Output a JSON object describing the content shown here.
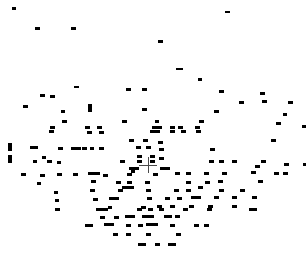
{
  "chart_data": {
    "type": "scatter",
    "title": "",
    "subtitle": "",
    "xlabel": "",
    "ylabel": "",
    "xlim": [
      0,
      306
    ],
    "ylim": [
      0,
      258
    ],
    "grid": false,
    "legend": null,
    "annotations": [],
    "background_color": "#ffffff",
    "marker_color": "#000000",
    "cursor_color": "#4a4a4a",
    "marker_shape": "horizontal-dash",
    "point_count": 214,
    "cursor": {
      "label": "crosshair-cursor",
      "x": 148,
      "y": 165,
      "arm_length_h": 18,
      "arm_length_v": 16
    },
    "points": [
      {
        "x": 12,
        "y": 7,
        "w": 4,
        "h": 3
      },
      {
        "x": 225,
        "y": 11,
        "w": 5,
        "h": 2
      },
      {
        "x": 35,
        "y": 27,
        "w": 5,
        "h": 3
      },
      {
        "x": 71,
        "y": 27,
        "w": 5,
        "h": 3
      },
      {
        "x": 158,
        "y": 40,
        "w": 5,
        "h": 3
      },
      {
        "x": 176,
        "y": 68,
        "w": 7,
        "h": 2
      },
      {
        "x": 198,
        "y": 78,
        "w": 4,
        "h": 3
      },
      {
        "x": 74,
        "y": 86,
        "w": 5,
        "h": 2
      },
      {
        "x": 126,
        "y": 88,
        "w": 5,
        "h": 3
      },
      {
        "x": 142,
        "y": 88,
        "w": 5,
        "h": 3
      },
      {
        "x": 219,
        "y": 90,
        "w": 5,
        "h": 3
      },
      {
        "x": 40,
        "y": 94,
        "w": 5,
        "h": 3
      },
      {
        "x": 50,
        "y": 95,
        "w": 5,
        "h": 3
      },
      {
        "x": 260,
        "y": 92,
        "w": 5,
        "h": 3
      },
      {
        "x": 262,
        "y": 100,
        "w": 5,
        "h": 3
      },
      {
        "x": 239,
        "y": 101,
        "w": 5,
        "h": 3
      },
      {
        "x": 288,
        "y": 101,
        "w": 5,
        "h": 3
      },
      {
        "x": 23,
        "y": 105,
        "w": 5,
        "h": 3
      },
      {
        "x": 88,
        "y": 104,
        "w": 4,
        "h": 8
      },
      {
        "x": 142,
        "y": 108,
        "w": 5,
        "h": 3
      },
      {
        "x": 61,
        "y": 110,
        "w": 4,
        "h": 3
      },
      {
        "x": 214,
        "y": 110,
        "w": 5,
        "h": 3
      },
      {
        "x": 283,
        "y": 113,
        "w": 4,
        "h": 3
      },
      {
        "x": 62,
        "y": 120,
        "w": 5,
        "h": 3
      },
      {
        "x": 122,
        "y": 120,
        "w": 5,
        "h": 3
      },
      {
        "x": 155,
        "y": 120,
        "w": 4,
        "h": 3
      },
      {
        "x": 199,
        "y": 120,
        "w": 5,
        "h": 3
      },
      {
        "x": 276,
        "y": 122,
        "w": 5,
        "h": 3
      },
      {
        "x": 50,
        "y": 126,
        "w": 5,
        "h": 3
      },
      {
        "x": 85,
        "y": 126,
        "w": 5,
        "h": 3
      },
      {
        "x": 97,
        "y": 126,
        "w": 5,
        "h": 3
      },
      {
        "x": 152,
        "y": 126,
        "w": 10,
        "h": 3
      },
      {
        "x": 170,
        "y": 126,
        "w": 5,
        "h": 3
      },
      {
        "x": 178,
        "y": 126,
        "w": 5,
        "h": 3
      },
      {
        "x": 195,
        "y": 126,
        "w": 5,
        "h": 3
      },
      {
        "x": 302,
        "y": 125,
        "w": 4,
        "h": 3
      },
      {
        "x": 49,
        "y": 130,
        "w": 5,
        "h": 3
      },
      {
        "x": 87,
        "y": 131,
        "w": 5,
        "h": 3
      },
      {
        "x": 99,
        "y": 131,
        "w": 5,
        "h": 3
      },
      {
        "x": 150,
        "y": 130,
        "w": 10,
        "h": 3
      },
      {
        "x": 170,
        "y": 130,
        "w": 5,
        "h": 3
      },
      {
        "x": 181,
        "y": 130,
        "w": 5,
        "h": 3
      },
      {
        "x": 196,
        "y": 130,
        "w": 5,
        "h": 3
      },
      {
        "x": 129,
        "y": 139,
        "w": 5,
        "h": 3
      },
      {
        "x": 143,
        "y": 139,
        "w": 5,
        "h": 3
      },
      {
        "x": 158,
        "y": 141,
        "w": 5,
        "h": 3
      },
      {
        "x": 271,
        "y": 139,
        "w": 5,
        "h": 3
      },
      {
        "x": 8,
        "y": 143,
        "w": 4,
        "h": 8
      },
      {
        "x": 30,
        "y": 146,
        "w": 8,
        "h": 3
      },
      {
        "x": 58,
        "y": 147,
        "w": 5,
        "h": 3
      },
      {
        "x": 71,
        "y": 147,
        "w": 10,
        "h": 3
      },
      {
        "x": 82,
        "y": 147,
        "w": 5,
        "h": 3
      },
      {
        "x": 90,
        "y": 147,
        "w": 4,
        "h": 3
      },
      {
        "x": 99,
        "y": 147,
        "w": 5,
        "h": 3
      },
      {
        "x": 136,
        "y": 146,
        "w": 5,
        "h": 3
      },
      {
        "x": 146,
        "y": 146,
        "w": 5,
        "h": 3
      },
      {
        "x": 159,
        "y": 148,
        "w": 5,
        "h": 3
      },
      {
        "x": 210,
        "y": 148,
        "w": 5,
        "h": 3
      },
      {
        "x": 8,
        "y": 155,
        "w": 4,
        "h": 8
      },
      {
        "x": 42,
        "y": 156,
        "w": 4,
        "h": 3
      },
      {
        "x": 137,
        "y": 155,
        "w": 5,
        "h": 3
      },
      {
        "x": 150,
        "y": 155,
        "w": 5,
        "h": 3
      },
      {
        "x": 159,
        "y": 157,
        "w": 5,
        "h": 3
      },
      {
        "x": 33,
        "y": 160,
        "w": 4,
        "h": 3
      },
      {
        "x": 47,
        "y": 160,
        "w": 5,
        "h": 3
      },
      {
        "x": 57,
        "y": 161,
        "w": 4,
        "h": 3
      },
      {
        "x": 120,
        "y": 160,
        "w": 5,
        "h": 3
      },
      {
        "x": 137,
        "y": 160,
        "w": 5,
        "h": 3
      },
      {
        "x": 150,
        "y": 160,
        "w": 5,
        "h": 3
      },
      {
        "x": 209,
        "y": 160,
        "w": 5,
        "h": 3
      },
      {
        "x": 219,
        "y": 160,
        "w": 5,
        "h": 3
      },
      {
        "x": 232,
        "y": 160,
        "w": 5,
        "h": 3
      },
      {
        "x": 261,
        "y": 160,
        "w": 5,
        "h": 3
      },
      {
        "x": 129,
        "y": 167,
        "w": 10,
        "h": 3
      },
      {
        "x": 160,
        "y": 167,
        "w": 10,
        "h": 3
      },
      {
        "x": 255,
        "y": 165,
        "w": 5,
        "h": 3
      },
      {
        "x": 284,
        "y": 163,
        "w": 5,
        "h": 3
      },
      {
        "x": 303,
        "y": 163,
        "w": 3,
        "h": 3
      },
      {
        "x": 21,
        "y": 173,
        "w": 5,
        "h": 3
      },
      {
        "x": 40,
        "y": 174,
        "w": 5,
        "h": 3
      },
      {
        "x": 57,
        "y": 173,
        "w": 5,
        "h": 3
      },
      {
        "x": 73,
        "y": 173,
        "w": 5,
        "h": 3
      },
      {
        "x": 88,
        "y": 172,
        "w": 12,
        "h": 3
      },
      {
        "x": 103,
        "y": 174,
        "w": 5,
        "h": 3
      },
      {
        "x": 127,
        "y": 173,
        "w": 5,
        "h": 3
      },
      {
        "x": 131,
        "y": 170,
        "w": 4,
        "h": 3
      },
      {
        "x": 153,
        "y": 173,
        "w": 5,
        "h": 3
      },
      {
        "x": 175,
        "y": 172,
        "w": 5,
        "h": 3
      },
      {
        "x": 186,
        "y": 172,
        "w": 5,
        "h": 3
      },
      {
        "x": 204,
        "y": 172,
        "w": 5,
        "h": 3
      },
      {
        "x": 222,
        "y": 172,
        "w": 5,
        "h": 3
      },
      {
        "x": 251,
        "y": 171,
        "w": 5,
        "h": 3
      },
      {
        "x": 274,
        "y": 172,
        "w": 5,
        "h": 3
      },
      {
        "x": 283,
        "y": 172,
        "w": 5,
        "h": 3
      },
      {
        "x": 37,
        "y": 182,
        "w": 4,
        "h": 3
      },
      {
        "x": 91,
        "y": 180,
        "w": 5,
        "h": 3
      },
      {
        "x": 116,
        "y": 181,
        "w": 5,
        "h": 3
      },
      {
        "x": 127,
        "y": 181,
        "w": 5,
        "h": 3
      },
      {
        "x": 145,
        "y": 181,
        "w": 5,
        "h": 3
      },
      {
        "x": 186,
        "y": 181,
        "w": 5,
        "h": 3
      },
      {
        "x": 205,
        "y": 181,
        "w": 5,
        "h": 3
      },
      {
        "x": 218,
        "y": 180,
        "w": 5,
        "h": 3
      },
      {
        "x": 258,
        "y": 180,
        "w": 5,
        "h": 3
      },
      {
        "x": 54,
        "y": 191,
        "w": 4,
        "h": 3
      },
      {
        "x": 90,
        "y": 189,
        "w": 5,
        "h": 3
      },
      {
        "x": 118,
        "y": 189,
        "w": 5,
        "h": 3
      },
      {
        "x": 122,
        "y": 186,
        "w": 12,
        "h": 3
      },
      {
        "x": 146,
        "y": 189,
        "w": 5,
        "h": 3
      },
      {
        "x": 174,
        "y": 189,
        "w": 5,
        "h": 3
      },
      {
        "x": 186,
        "y": 189,
        "w": 5,
        "h": 3
      },
      {
        "x": 198,
        "y": 186,
        "w": 5,
        "h": 3
      },
      {
        "x": 219,
        "y": 189,
        "w": 5,
        "h": 3
      },
      {
        "x": 240,
        "y": 189,
        "w": 5,
        "h": 3
      },
      {
        "x": 55,
        "y": 199,
        "w": 4,
        "h": 3
      },
      {
        "x": 93,
        "y": 198,
        "w": 5,
        "h": 3
      },
      {
        "x": 109,
        "y": 197,
        "w": 10,
        "h": 3
      },
      {
        "x": 147,
        "y": 197,
        "w": 5,
        "h": 3
      },
      {
        "x": 165,
        "y": 197,
        "w": 5,
        "h": 3
      },
      {
        "x": 177,
        "y": 197,
        "w": 5,
        "h": 3
      },
      {
        "x": 191,
        "y": 196,
        "w": 10,
        "h": 3
      },
      {
        "x": 214,
        "y": 196,
        "w": 5,
        "h": 3
      },
      {
        "x": 232,
        "y": 196,
        "w": 5,
        "h": 3
      },
      {
        "x": 252,
        "y": 196,
        "w": 5,
        "h": 3
      },
      {
        "x": 108,
        "y": 206,
        "w": 4,
        "h": 3
      },
      {
        "x": 141,
        "y": 206,
        "w": 5,
        "h": 3
      },
      {
        "x": 157,
        "y": 205,
        "w": 5,
        "h": 3
      },
      {
        "x": 170,
        "y": 205,
        "w": 5,
        "h": 3
      },
      {
        "x": 189,
        "y": 205,
        "w": 5,
        "h": 3
      },
      {
        "x": 208,
        "y": 205,
        "w": 5,
        "h": 3
      },
      {
        "x": 232,
        "y": 205,
        "w": 5,
        "h": 3
      },
      {
        "x": 55,
        "y": 208,
        "w": 5,
        "h": 3
      },
      {
        "x": 96,
        "y": 208,
        "w": 12,
        "h": 3
      },
      {
        "x": 137,
        "y": 208,
        "w": 5,
        "h": 3
      },
      {
        "x": 148,
        "y": 208,
        "w": 5,
        "h": 3
      },
      {
        "x": 159,
        "y": 208,
        "w": 5,
        "h": 3
      },
      {
        "x": 183,
        "y": 208,
        "w": 5,
        "h": 3
      },
      {
        "x": 207,
        "y": 208,
        "w": 5,
        "h": 3
      },
      {
        "x": 249,
        "y": 208,
        "w": 8,
        "h": 3
      },
      {
        "x": 100,
        "y": 216,
        "w": 5,
        "h": 3
      },
      {
        "x": 114,
        "y": 216,
        "w": 5,
        "h": 3
      },
      {
        "x": 125,
        "y": 215,
        "w": 10,
        "h": 3
      },
      {
        "x": 142,
        "y": 215,
        "w": 12,
        "h": 3
      },
      {
        "x": 164,
        "y": 215,
        "w": 8,
        "h": 3
      },
      {
        "x": 175,
        "y": 215,
        "w": 5,
        "h": 3
      },
      {
        "x": 85,
        "y": 224,
        "w": 8,
        "h": 3
      },
      {
        "x": 104,
        "y": 223,
        "w": 10,
        "h": 3
      },
      {
        "x": 126,
        "y": 224,
        "w": 5,
        "h": 3
      },
      {
        "x": 138,
        "y": 224,
        "w": 5,
        "h": 3
      },
      {
        "x": 146,
        "y": 223,
        "w": 12,
        "h": 3
      },
      {
        "x": 170,
        "y": 224,
        "w": 5,
        "h": 3
      },
      {
        "x": 194,
        "y": 224,
        "w": 5,
        "h": 3
      },
      {
        "x": 204,
        "y": 224,
        "w": 5,
        "h": 3
      },
      {
        "x": 113,
        "y": 233,
        "w": 5,
        "h": 3
      },
      {
        "x": 126,
        "y": 233,
        "w": 5,
        "h": 3
      },
      {
        "x": 146,
        "y": 233,
        "w": 5,
        "h": 3
      },
      {
        "x": 176,
        "y": 233,
        "w": 5,
        "h": 3
      },
      {
        "x": 138,
        "y": 243,
        "w": 8,
        "h": 3
      },
      {
        "x": 155,
        "y": 243,
        "w": 5,
        "h": 3
      },
      {
        "x": 168,
        "y": 243,
        "w": 8,
        "h": 3
      }
    ]
  }
}
